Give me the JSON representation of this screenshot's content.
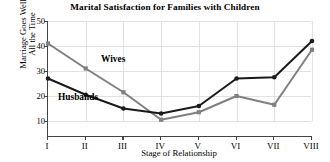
{
  "chart_data": {
    "type": "line",
    "title": "Marital Satisfaction for Families with Children",
    "xlabel": "Stage of Relationship",
    "ylabel": "Marriage Goes Well All the Time",
    "ylabel_line1": "Marriage Goes Well",
    "ylabel_line2": "All the Time",
    "categories": [
      "I",
      "II",
      "III",
      "IV",
      "V",
      "VI",
      "VII",
      "VIII"
    ],
    "x": [
      1,
      2,
      3,
      4,
      5,
      6,
      7,
      8
    ],
    "ylim": [
      0,
      50
    ],
    "yticks": [
      10,
      20,
      30,
      40,
      50
    ],
    "ytick_labels": [
      "10",
      "20",
      "30",
      "40",
      "50"
    ],
    "grid": true,
    "legend": "inline-labels",
    "series": [
      {
        "name": "Wives",
        "color": "#808080",
        "marker": "square",
        "values": [
          41,
          31,
          21.5,
          10.5,
          13.5,
          20,
          16.5,
          38.5
        ],
        "label_text": "Wives"
      },
      {
        "name": "Husbands",
        "color": "#1a1a1a",
        "marker": "circle",
        "values": [
          27,
          20.5,
          15,
          13,
          16,
          27,
          27.5,
          42
        ],
        "label_text": "Husbands"
      }
    ],
    "annotations": [
      {
        "text": "Wives",
        "series": "Wives"
      },
      {
        "text": "Husbands",
        "series": "Husbands"
      }
    ]
  },
  "colors": {
    "axis": "#444444",
    "grid": "#e2e2e2",
    "background": "#ffffff",
    "wives": "#808080",
    "husbands": "#1a1a1a"
  }
}
